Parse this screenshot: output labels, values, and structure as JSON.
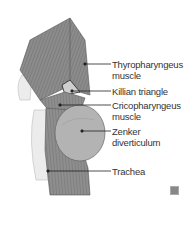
{
  "figure": {
    "labels": [
      {
        "line1": "Thyropharyngeus",
        "line2": "muscle"
      },
      {
        "line1": "Killian triangle",
        "line2": ""
      },
      {
        "line1": "Cricopharyngeus",
        "line2": "muscle"
      },
      {
        "line1": "Zenker",
        "line2": "diverticulum"
      },
      {
        "line1": "Trachea",
        "line2": ""
      }
    ],
    "colors": {
      "muscle": "#8a8a8a",
      "diverticulum": "#b5b5b5",
      "trachea": "#e6e6e6",
      "leader": "#222222"
    }
  }
}
